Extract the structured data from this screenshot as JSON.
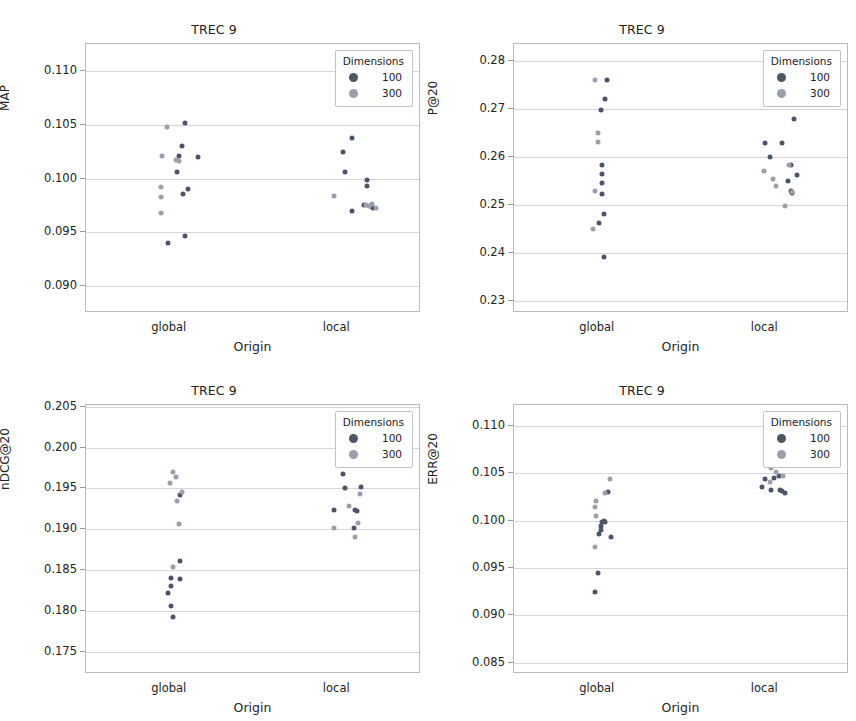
{
  "figure": {
    "panel_count": 4,
    "shared_xlabel": "Origin",
    "shared_title": "TREC 9",
    "categories": [
      "global",
      "local"
    ],
    "colors": {
      "dim100": "#4c5568",
      "dim300": "#9aa0ab",
      "gridline": "#d6d6d6",
      "frame": "#b9b9b9"
    }
  },
  "legend": {
    "title": "Dimensions",
    "entries": [
      {
        "label": "100",
        "color": "#4c5568"
      },
      {
        "label": "300",
        "color": "#9aa0ab"
      }
    ]
  },
  "chart_data": [
    {
      "type": "scatter",
      "id": "map",
      "title": "TREC 9",
      "xlabel": "Origin",
      "ylabel": "MAP",
      "categories": [
        "global",
        "local"
      ],
      "ylim": [
        0.0875,
        0.1125
      ],
      "yticks": [
        0.09,
        0.095,
        0.1,
        0.105,
        0.11
      ],
      "ytick_labels": [
        "0.090",
        "0.095",
        "0.100",
        "0.105",
        "0.110"
      ],
      "grid": true,
      "legend_position": "top-right",
      "series": [
        {
          "name": "100",
          "color": "#4c5568",
          "points": [
            {
              "x": "global",
              "jitter": 0.1,
              "y": 0.1052
            },
            {
              "x": "global",
              "jitter": 0.08,
              "y": 0.103
            },
            {
              "x": "global",
              "jitter": 0.06,
              "y": 0.1021
            },
            {
              "x": "global",
              "jitter": 0.19,
              "y": 0.102
            },
            {
              "x": "global",
              "jitter": 0.05,
              "y": 0.1006
            },
            {
              "x": "global",
              "jitter": 0.12,
              "y": 0.099
            },
            {
              "x": "global",
              "jitter": 0.09,
              "y": 0.0986
            },
            {
              "x": "global",
              "jitter": 0.1,
              "y": 0.0947
            },
            {
              "x": "global",
              "jitter": -0.01,
              "y": 0.094
            },
            {
              "x": "local",
              "jitter": 0.1,
              "y": 0.1038
            },
            {
              "x": "local",
              "jitter": 0.04,
              "y": 0.1025
            },
            {
              "x": "local",
              "jitter": 0.05,
              "y": 0.1006
            },
            {
              "x": "local",
              "jitter": 0.2,
              "y": 0.0999
            },
            {
              "x": "local",
              "jitter": 0.2,
              "y": 0.0993
            },
            {
              "x": "local",
              "jitter": 0.18,
              "y": 0.0975
            },
            {
              "x": "local",
              "jitter": 0.22,
              "y": 0.0974
            },
            {
              "x": "local",
              "jitter": 0.24,
              "y": 0.0973
            },
            {
              "x": "local",
              "jitter": 0.1,
              "y": 0.097
            }
          ]
        },
        {
          "name": "300",
          "color": "#9aa0ab",
          "points": [
            {
              "x": "global",
              "jitter": -0.02,
              "y": 0.1048
            },
            {
              "x": "global",
              "jitter": -0.05,
              "y": 0.1021
            },
            {
              "x": "global",
              "jitter": 0.04,
              "y": 0.1017
            },
            {
              "x": "global",
              "jitter": 0.06,
              "y": 0.1016
            },
            {
              "x": "global",
              "jitter": -0.06,
              "y": 0.0992
            },
            {
              "x": "global",
              "jitter": -0.06,
              "y": 0.0983
            },
            {
              "x": "global",
              "jitter": -0.06,
              "y": 0.0968
            },
            {
              "x": "local",
              "jitter": -0.02,
              "y": 0.0984
            },
            {
              "x": "local",
              "jitter": 0.19,
              "y": 0.0975
            },
            {
              "x": "local",
              "jitter": 0.21,
              "y": 0.0974
            },
            {
              "x": "local",
              "jitter": 0.26,
              "y": 0.0973
            },
            {
              "x": "local",
              "jitter": 0.23,
              "y": 0.0976
            }
          ]
        }
      ]
    },
    {
      "type": "scatter",
      "id": "p20",
      "title": "TREC 9",
      "xlabel": "Origin",
      "ylabel": "P@20",
      "categories": [
        "global",
        "local"
      ],
      "ylim": [
        0.2275,
        0.2835
      ],
      "yticks": [
        0.23,
        0.24,
        0.25,
        0.26,
        0.27,
        0.28
      ],
      "ytick_labels": [
        "0.23",
        "0.24",
        "0.25",
        "0.26",
        "0.27",
        "0.28"
      ],
      "grid": true,
      "legend_position": "top-right",
      "series": [
        {
          "name": "100",
          "color": "#4c5568",
          "points": [
            {
              "x": "global",
              "jitter": 0.06,
              "y": 0.276
            },
            {
              "x": "global",
              "jitter": 0.05,
              "y": 0.272
            },
            {
              "x": "global",
              "jitter": 0.02,
              "y": 0.2697
            },
            {
              "x": "global",
              "jitter": 0.03,
              "y": 0.2583
            },
            {
              "x": "global",
              "jitter": 0.03,
              "y": 0.2565
            },
            {
              "x": "global",
              "jitter": 0.03,
              "y": 0.2545
            },
            {
              "x": "global",
              "jitter": 0.03,
              "y": 0.2523
            },
            {
              "x": "global",
              "jitter": 0.04,
              "y": 0.2482
            },
            {
              "x": "global",
              "jitter": 0.01,
              "y": 0.2462
            },
            {
              "x": "global",
              "jitter": 0.04,
              "y": 0.2392
            },
            {
              "x": "local",
              "jitter": 0.19,
              "y": 0.2678
            },
            {
              "x": "local",
              "jitter": 0.0,
              "y": 0.2628
            },
            {
              "x": "local",
              "jitter": 0.11,
              "y": 0.2628
            },
            {
              "x": "local",
              "jitter": 0.03,
              "y": 0.26
            },
            {
              "x": "local",
              "jitter": 0.17,
              "y": 0.2583
            },
            {
              "x": "local",
              "jitter": 0.21,
              "y": 0.2562
            },
            {
              "x": "local",
              "jitter": 0.15,
              "y": 0.2549
            },
            {
              "x": "local",
              "jitter": 0.17,
              "y": 0.2529
            },
            {
              "x": "local",
              "jitter": 0.18,
              "y": 0.2525
            }
          ]
        },
        {
          "name": "300",
          "color": "#9aa0ab",
          "points": [
            {
              "x": "global",
              "jitter": -0.02,
              "y": 0.276
            },
            {
              "x": "global",
              "jitter": 0.0,
              "y": 0.265
            },
            {
              "x": "global",
              "jitter": 0.0,
              "y": 0.263
            },
            {
              "x": "global",
              "jitter": -0.02,
              "y": 0.253
            },
            {
              "x": "global",
              "jitter": -0.03,
              "y": 0.245
            },
            {
              "x": "local",
              "jitter": -0.01,
              "y": 0.257
            },
            {
              "x": "local",
              "jitter": 0.05,
              "y": 0.2553
            },
            {
              "x": "local",
              "jitter": 0.07,
              "y": 0.254
            },
            {
              "x": "local",
              "jitter": 0.16,
              "y": 0.2583
            },
            {
              "x": "local",
              "jitter": 0.18,
              "y": 0.2526
            },
            {
              "x": "local",
              "jitter": 0.13,
              "y": 0.2497
            }
          ]
        }
      ]
    },
    {
      "type": "scatter",
      "id": "ndcg20",
      "title": "TREC 9",
      "xlabel": "Origin",
      "ylabel": "nDCG@20",
      "categories": [
        "global",
        "local"
      ],
      "ylim": [
        0.1723,
        0.2052
      ],
      "yticks": [
        0.175,
        0.18,
        0.185,
        0.19,
        0.195,
        0.2,
        0.205
      ],
      "ytick_labels": [
        "0.175",
        "0.180",
        "0.185",
        "0.190",
        "0.195",
        "0.200",
        "0.205"
      ],
      "grid": true,
      "legend_position": "top-right",
      "series": [
        {
          "name": "100",
          "color": "#4c5568",
          "points": [
            {
              "x": "global",
              "jitter": 0.07,
              "y": 0.1942
            },
            {
              "x": "global",
              "jitter": 0.07,
              "y": 0.1861
            },
            {
              "x": "global",
              "jitter": 0.07,
              "y": 0.1839
            },
            {
              "x": "global",
              "jitter": 0.01,
              "y": 0.184
            },
            {
              "x": "global",
              "jitter": 0.01,
              "y": 0.1831
            },
            {
              "x": "global",
              "jitter": -0.01,
              "y": 0.1822
            },
            {
              "x": "global",
              "jitter": 0.01,
              "y": 0.1806
            },
            {
              "x": "global",
              "jitter": 0.02,
              "y": 0.1793
            },
            {
              "x": "local",
              "jitter": 0.01,
              "y": 0.1986
            },
            {
              "x": "local",
              "jitter": 0.14,
              "y": 0.1987
            },
            {
              "x": "local",
              "jitter": 0.04,
              "y": 0.1968
            },
            {
              "x": "local",
              "jitter": 0.05,
              "y": 0.1951
            },
            {
              "x": "local",
              "jitter": 0.16,
              "y": 0.1952
            },
            {
              "x": "local",
              "jitter": -0.02,
              "y": 0.1924
            },
            {
              "x": "local",
              "jitter": 0.12,
              "y": 0.1923
            },
            {
              "x": "local",
              "jitter": 0.13,
              "y": 0.1922
            },
            {
              "x": "local",
              "jitter": 0.11,
              "y": 0.1901
            }
          ]
        },
        {
          "name": "300",
          "color": "#9aa0ab",
          "points": [
            {
              "x": "global",
              "jitter": 0.02,
              "y": 0.197
            },
            {
              "x": "global",
              "jitter": 0.04,
              "y": 0.1964
            },
            {
              "x": "global",
              "jitter": 0.0,
              "y": 0.1957
            },
            {
              "x": "global",
              "jitter": 0.08,
              "y": 0.1945
            },
            {
              "x": "global",
              "jitter": 0.05,
              "y": 0.1934
            },
            {
              "x": "global",
              "jitter": 0.06,
              "y": 0.1906
            },
            {
              "x": "global",
              "jitter": 0.02,
              "y": 0.1854
            },
            {
              "x": "local",
              "jitter": 0.08,
              "y": 0.1928
            },
            {
              "x": "local",
              "jitter": 0.15,
              "y": 0.1943
            },
            {
              "x": "local",
              "jitter": -0.02,
              "y": 0.1901
            },
            {
              "x": "local",
              "jitter": 0.14,
              "y": 0.1908
            },
            {
              "x": "local",
              "jitter": 0.12,
              "y": 0.1891
            }
          ]
        }
      ]
    },
    {
      "type": "scatter",
      "id": "err20",
      "title": "TREC 9",
      "xlabel": "Origin",
      "ylabel": "ERR@20",
      "categories": [
        "global",
        "local"
      ],
      "ylim": [
        0.0838,
        0.1122
      ],
      "yticks": [
        0.085,
        0.09,
        0.095,
        0.1,
        0.105,
        0.11
      ],
      "ytick_labels": [
        "0.085",
        "0.090",
        "0.095",
        "0.100",
        "0.105",
        "0.110"
      ],
      "grid": true,
      "legend_position": "top-right",
      "series": [
        {
          "name": "100",
          "color": "#4c5568",
          "points": [
            {
              "x": "global",
              "jitter": 0.07,
              "y": 0.103
            },
            {
              "x": "global",
              "jitter": 0.04,
              "y": 0.1
            },
            {
              "x": "global",
              "jitter": 0.05,
              "y": 0.0999
            },
            {
              "x": "global",
              "jitter": 0.03,
              "y": 0.0998
            },
            {
              "x": "global",
              "jitter": 0.02,
              "y": 0.0994
            },
            {
              "x": "global",
              "jitter": 0.02,
              "y": 0.099
            },
            {
              "x": "global",
              "jitter": 0.01,
              "y": 0.0986
            },
            {
              "x": "global",
              "jitter": 0.09,
              "y": 0.0983
            },
            {
              "x": "global",
              "jitter": 0.0,
              "y": 0.0945
            },
            {
              "x": "global",
              "jitter": -0.02,
              "y": 0.0925
            },
            {
              "x": "local",
              "jitter": 0.01,
              "y": 0.1097
            },
            {
              "x": "local",
              "jitter": 0.0,
              "y": 0.1044
            },
            {
              "x": "local",
              "jitter": 0.06,
              "y": 0.1045
            },
            {
              "x": "local",
              "jitter": 0.09,
              "y": 0.1047
            },
            {
              "x": "local",
              "jitter": -0.02,
              "y": 0.1035
            },
            {
              "x": "local",
              "jitter": 0.04,
              "y": 0.1032
            },
            {
              "x": "local",
              "jitter": 0.1,
              "y": 0.1032
            },
            {
              "x": "local",
              "jitter": 0.11,
              "y": 0.1031
            },
            {
              "x": "local",
              "jitter": 0.13,
              "y": 0.1029
            }
          ]
        },
        {
          "name": "300",
          "color": "#9aa0ab",
          "points": [
            {
              "x": "global",
              "jitter": 0.08,
              "y": 0.1044
            },
            {
              "x": "global",
              "jitter": 0.05,
              "y": 0.1029
            },
            {
              "x": "global",
              "jitter": -0.01,
              "y": 0.1021
            },
            {
              "x": "global",
              "jitter": -0.02,
              "y": 0.1014
            },
            {
              "x": "global",
              "jitter": -0.01,
              "y": 0.1005
            },
            {
              "x": "global",
              "jitter": -0.02,
              "y": 0.0972
            },
            {
              "x": "local",
              "jitter": 0.01,
              "y": 0.1076
            },
            {
              "x": "local",
              "jitter": 0.16,
              "y": 0.1067
            },
            {
              "x": "local",
              "jitter": 0.04,
              "y": 0.1056
            },
            {
              "x": "local",
              "jitter": 0.07,
              "y": 0.1051
            },
            {
              "x": "local",
              "jitter": 0.12,
              "y": 0.1047
            },
            {
              "x": "local",
              "jitter": 0.03,
              "y": 0.1041
            }
          ]
        }
      ]
    }
  ]
}
